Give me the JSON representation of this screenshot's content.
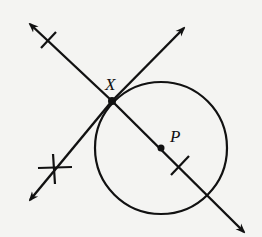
{
  "diagram": {
    "type": "geometry-construction",
    "points": {
      "X": {
        "label": "X",
        "x": 112,
        "y": 101
      },
      "P": {
        "label": "P",
        "x": 161,
        "y": 148
      }
    },
    "circle": {
      "center": "P",
      "radius": 66
    },
    "lines": [
      {
        "name": "line-XP",
        "from": [
          30,
          24
        ],
        "to": [
          244,
          232
        ],
        "arrows": "both"
      },
      {
        "name": "tangent-at-X",
        "from": [
          30,
          200
        ],
        "to": [
          184,
          28
        ],
        "arrows": "both"
      }
    ],
    "tick_marks": [
      {
        "on": "line-XP",
        "at": [
          48,
          40
        ]
      },
      {
        "on": "line-XP",
        "at": [
          180,
          167
        ]
      },
      {
        "on": "tangent-at-X",
        "at": [
          54,
          169
        ],
        "style": "cross"
      }
    ],
    "colors": {
      "ink": "#111111",
      "paper": "#f4f4f2"
    }
  }
}
